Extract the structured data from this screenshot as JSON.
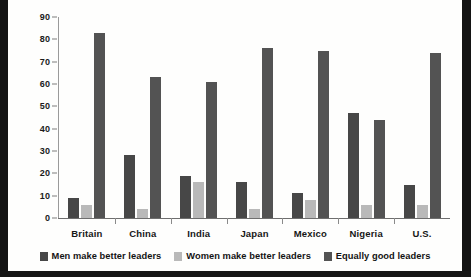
{
  "chart_data": {
    "type": "bar",
    "title": "",
    "subtitle": "",
    "xlabel": "",
    "ylabel": "",
    "ylim": [
      0,
      90
    ],
    "ytick_step": 10,
    "yticks": [
      90,
      80,
      70,
      60,
      50,
      40,
      30,
      20,
      10,
      0
    ],
    "grid": false,
    "legend_position": "bottom",
    "categories": [
      "Britain",
      "China",
      "India",
      "Japan",
      "Mexico",
      "Nigeria",
      "U.S."
    ],
    "series": [
      {
        "name": "Men make better leaders",
        "color": "#474747",
        "values": [
          9,
          28,
          19,
          16,
          11,
          47,
          15
        ]
      },
      {
        "name": "Women make better leaders",
        "color": "#b9b9b9",
        "values": [
          6,
          4,
          16,
          4,
          8,
          6,
          6
        ]
      },
      {
        "name": "Equally good leaders",
        "color": "#535353",
        "values": [
          83,
          63,
          61,
          76,
          75,
          44,
          74
        ]
      }
    ]
  },
  "legend": {
    "items": [
      {
        "label": "Men make better leaders",
        "swatch": "legend-swatch-men"
      },
      {
        "label": "Women make better leaders",
        "swatch": "legend-swatch-women"
      },
      {
        "label": "Equally good leaders",
        "swatch": "legend-swatch-equal"
      }
    ]
  },
  "colors": {
    "series_men": "#474747",
    "series_women": "#b9b9b9",
    "series_equal": "#535353",
    "axis": "#6e6e6e",
    "text": "#141414",
    "background": "#fefefd",
    "border": "#141414"
  }
}
